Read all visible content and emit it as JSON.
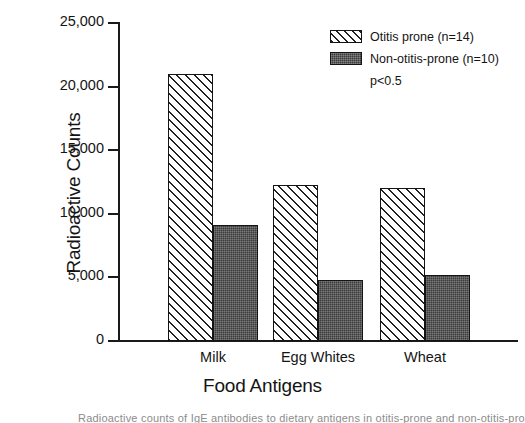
{
  "chart_data": {
    "type": "bar",
    "title": "",
    "xlabel": "Food Antigens",
    "ylabel": "Radioactive Counts",
    "categories": [
      "Milk",
      "Egg Whites",
      "Wheat"
    ],
    "series": [
      {
        "name": "Otitis prone (n=14)",
        "values": [
          21000,
          12300,
          12000
        ],
        "fill": "diagonal-hatch"
      },
      {
        "name": "Non-otitis-prone (n=10)",
        "values": [
          9100,
          4800,
          5200
        ],
        "fill": "dark-stipple"
      }
    ],
    "ylim": [
      0,
      25000
    ],
    "ytick_values": [
      0,
      5000,
      10000,
      15000,
      20000,
      25000
    ],
    "ytick_labels": [
      "0",
      "5,000",
      "10,000",
      "15,000",
      "20,000",
      "25,000"
    ],
    "grid": false,
    "legend_position": "top-right",
    "annotations": [
      "p<0.5"
    ]
  },
  "axes": {
    "y_title": "Radioactive Counts",
    "x_title": "Food Antigens"
  },
  "legend": {
    "entries": [
      {
        "label": "Otitis prone (n=14)",
        "swatch": "hatched-swatch"
      },
      {
        "label": "Non-otitis-prone (n=10)",
        "swatch": "solid-swatch"
      }
    ],
    "pvalue": "p<0.5"
  },
  "caption": {
    "clipped_text": "Radioactive counts of IgE antibodies to dietary antigens in otitis-prone and non-otitis-prone"
  },
  "colors": {
    "ink": "#141414",
    "hatch": "#222222",
    "solid_fill": "#3b3b3b",
    "background": "#ffffff"
  }
}
